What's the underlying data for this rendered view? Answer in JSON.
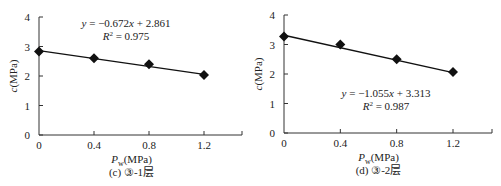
{
  "chart_data": [
    {
      "type": "scatter",
      "panel": "c",
      "title": "(c) ③-1层",
      "xlabel": "P_w(MPa)",
      "ylabel": "c(MPa)",
      "xlim": [
        0,
        1.4
      ],
      "ylim": [
        0,
        4
      ],
      "xticks": [
        "0",
        "0.4",
        "0.8",
        "1.2"
      ],
      "yticks": [
        "0",
        "1",
        "2",
        "3",
        "4"
      ],
      "grid": false,
      "series": [
        {
          "name": "data",
          "marker": "diamond",
          "x": [
            0,
            0.4,
            0.8,
            1.2
          ],
          "y": [
            2.83,
            2.6,
            2.4,
            2.03
          ]
        }
      ],
      "trendline": {
        "slope": -0.672,
        "intercept": 2.861,
        "equation": "y = −0.672x + 2.861",
        "r2": "R² = 0.975"
      }
    },
    {
      "type": "scatter",
      "panel": "d",
      "title": "(d) ③-2层",
      "xlabel": "P_w(MPa)",
      "ylabel": "c(MPa)",
      "xlim": [
        0,
        1.4
      ],
      "ylim": [
        0,
        4
      ],
      "xticks": [
        "0",
        "0.4",
        "0.8",
        "1.2"
      ],
      "yticks": [
        "0",
        "1",
        "2",
        "3",
        "4"
      ],
      "grid": false,
      "series": [
        {
          "name": "data",
          "marker": "diamond",
          "x": [
            0,
            0.4,
            0.8,
            1.2
          ],
          "y": [
            3.27,
            3.0,
            2.5,
            2.07
          ]
        }
      ],
      "trendline": {
        "slope": -1.055,
        "intercept": 3.313,
        "equation": "y = −1.055x + 3.313",
        "r2": "R² = 0.987"
      }
    }
  ],
  "labels": {
    "left": {
      "ylabel": "c(MPa)",
      "xlabel_main": "P",
      "xlabel_sub": "w",
      "xlabel_unit": "(MPa)",
      "equation": "y = −0.672x + 2.861",
      "r2": "R² = 0.975",
      "caption": "(c) ③-1层"
    },
    "right": {
      "ylabel": "c(MPa)",
      "xlabel_main": "P",
      "xlabel_sub": "w",
      "xlabel_unit": "(MPa)",
      "equation": "y = −1.055x + 3.313",
      "r2": "R² = 0.987",
      "caption": "(d) ③-2层"
    }
  },
  "colors": {
    "axis": "#333333",
    "line": "#111111",
    "marker": "#111111"
  }
}
